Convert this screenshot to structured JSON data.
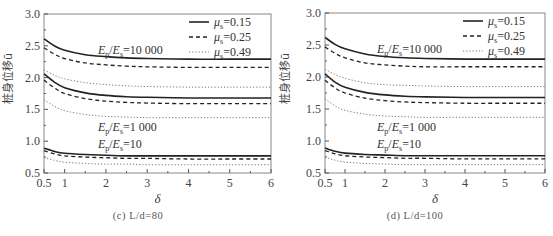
{
  "figure": {
    "captions": [
      "(c) L/d=80",
      "(d) L/d=100"
    ],
    "ylabel": "桩身位移ū",
    "xlabel": "δ",
    "legend": [
      {
        "label": "μs=0.15",
        "mu": "μ",
        "sub": "s",
        "value": "=0.15",
        "style": "solid"
      },
      {
        "label": "μs=0.25",
        "mu": "μ",
        "sub": "s",
        "value": "=0.25",
        "style": "dashed"
      },
      {
        "label": "μs=0.49",
        "mu": "μ",
        "sub": "s",
        "value": "=0.49",
        "style": "dotted"
      }
    ],
    "annotations": [
      "Ep/Es=10 000",
      "Ep/Es=1 000",
      "Ep/Es=10"
    ],
    "colors": {
      "line": "#222222",
      "dotted": "#777777",
      "axis": "#555555"
    }
  },
  "chart_data": [
    {
      "type": "line",
      "title": "(c) L/d=80",
      "xlabel": "δ",
      "ylabel": "桩身位移ū",
      "xlim": [
        0.5,
        6
      ],
      "ylim": [
        0.5,
        3.0
      ],
      "xticks": [
        0.5,
        1,
        2,
        3,
        4,
        5,
        6
      ],
      "xtick_labels": [
        "0.5",
        "1",
        "2",
        "3",
        "4",
        "5",
        "6"
      ],
      "yticks": [
        0.5,
        1.0,
        1.5,
        2.0,
        2.5,
        3.0
      ],
      "ytick_labels": [
        "0.5",
        "1.0",
        "1.5",
        "2.0",
        "2.5",
        "3.0"
      ],
      "grid": false,
      "legend_position": "upper right",
      "x": [
        0.5,
        0.75,
        1,
        1.5,
        2,
        2.5,
        3,
        4,
        5,
        6
      ],
      "series": [
        {
          "name": "Ep/Es=10 000, μs=0.15",
          "style": "solid",
          "values": [
            2.61,
            2.5,
            2.43,
            2.36,
            2.33,
            2.31,
            2.3,
            2.29,
            2.29,
            2.29
          ]
        },
        {
          "name": "Ep/Es=10 000, μs=0.25",
          "style": "dashed",
          "values": [
            2.47,
            2.37,
            2.3,
            2.23,
            2.2,
            2.18,
            2.17,
            2.16,
            2.16,
            2.16
          ]
        },
        {
          "name": "Ep/Es=10 000, μs=0.49",
          "style": "dotted",
          "values": [
            2.12,
            2.04,
            1.98,
            1.92,
            1.89,
            1.87,
            1.86,
            1.85,
            1.85,
            1.85
          ]
        },
        {
          "name": "Ep/Es=1 000, μs=0.15",
          "style": "solid",
          "values": [
            2.06,
            1.93,
            1.84,
            1.76,
            1.72,
            1.7,
            1.69,
            1.68,
            1.68,
            1.68
          ]
        },
        {
          "name": "Ep/Es=1 000, μs=0.25",
          "style": "dashed",
          "values": [
            1.96,
            1.84,
            1.75,
            1.67,
            1.63,
            1.61,
            1.6,
            1.59,
            1.59,
            1.59
          ]
        },
        {
          "name": "Ep/Es=1 000, μs=0.49",
          "style": "dotted",
          "values": [
            1.65,
            1.55,
            1.48,
            1.42,
            1.39,
            1.38,
            1.37,
            1.37,
            1.37,
            1.37
          ]
        },
        {
          "name": "Ep/Es=10, μs=0.15",
          "style": "solid",
          "values": [
            0.89,
            0.84,
            0.81,
            0.79,
            0.78,
            0.77,
            0.77,
            0.77,
            0.77,
            0.77
          ]
        },
        {
          "name": "Ep/Es=10, μs=0.25",
          "style": "dashed",
          "values": [
            0.85,
            0.8,
            0.77,
            0.75,
            0.74,
            0.73,
            0.73,
            0.72,
            0.72,
            0.72
          ]
        },
        {
          "name": "Ep/Es=10, μs=0.49",
          "style": "dotted",
          "values": [
            0.75,
            0.7,
            0.67,
            0.65,
            0.64,
            0.64,
            0.63,
            0.63,
            0.63,
            0.63
          ]
        }
      ],
      "annotations": [
        {
          "text": "Ep/Es=10 000",
          "x": 2.0,
          "y": 2.43
        },
        {
          "text": "Ep/Es=1 000",
          "x": 2.0,
          "y": 1.22
        },
        {
          "text": "Ep/Es=10",
          "x": 2.0,
          "y": 0.96
        }
      ]
    },
    {
      "type": "line",
      "title": "(d) L/d=100",
      "xlabel": "δ",
      "ylabel": "桩身位移ū",
      "xlim": [
        0.5,
        6
      ],
      "ylim": [
        0.5,
        3.0
      ],
      "xticks": [
        0.5,
        1,
        2,
        3,
        4,
        5,
        6
      ],
      "xtick_labels": [
        "0.5",
        "1",
        "2",
        "3",
        "4",
        "5",
        "6"
      ],
      "yticks": [
        0.5,
        1.0,
        1.5,
        2.0,
        2.5,
        3.0
      ],
      "ytick_labels": [
        "0.5",
        "1.0",
        "1.5",
        "2.0",
        "2.5",
        "3.0"
      ],
      "grid": false,
      "legend_position": "upper right",
      "x": [
        0.5,
        0.75,
        1,
        1.5,
        2,
        2.5,
        3,
        4,
        5,
        6
      ],
      "series": [
        {
          "name": "Ep/Es=10 000, μs=0.15",
          "style": "solid",
          "values": [
            2.62,
            2.51,
            2.44,
            2.36,
            2.32,
            2.3,
            2.29,
            2.28,
            2.28,
            2.28
          ]
        },
        {
          "name": "Ep/Es=10 000, μs=0.25",
          "style": "dashed",
          "values": [
            2.47,
            2.37,
            2.3,
            2.22,
            2.19,
            2.17,
            2.16,
            2.16,
            2.16,
            2.16
          ]
        },
        {
          "name": "Ep/Es=10 000, μs=0.49",
          "style": "dotted",
          "values": [
            2.12,
            2.04,
            1.98,
            1.91,
            1.88,
            1.87,
            1.86,
            1.85,
            1.85,
            1.85
          ]
        },
        {
          "name": "Ep/Es=1 000, μs=0.15",
          "style": "solid",
          "values": [
            2.05,
            1.92,
            1.84,
            1.76,
            1.72,
            1.7,
            1.69,
            1.68,
            1.68,
            1.68
          ]
        },
        {
          "name": "Ep/Es=1 000, μs=0.25",
          "style": "dashed",
          "values": [
            1.95,
            1.83,
            1.75,
            1.67,
            1.63,
            1.61,
            1.6,
            1.59,
            1.59,
            1.59
          ]
        },
        {
          "name": "Ep/Es=1 000, μs=0.49",
          "style": "dotted",
          "values": [
            1.66,
            1.55,
            1.48,
            1.42,
            1.39,
            1.38,
            1.37,
            1.37,
            1.37,
            1.37
          ]
        },
        {
          "name": "Ep/Es=10, μs=0.15",
          "style": "solid",
          "values": [
            0.89,
            0.84,
            0.81,
            0.79,
            0.78,
            0.77,
            0.77,
            0.77,
            0.77,
            0.77
          ]
        },
        {
          "name": "Ep/Es=10, μs=0.25",
          "style": "dashed",
          "values": [
            0.85,
            0.8,
            0.77,
            0.75,
            0.74,
            0.73,
            0.73,
            0.72,
            0.72,
            0.72
          ]
        },
        {
          "name": "Ep/Es=10, μs=0.49",
          "style": "dotted",
          "values": [
            0.75,
            0.7,
            0.67,
            0.65,
            0.64,
            0.63,
            0.63,
            0.63,
            0.63,
            0.63
          ]
        }
      ],
      "annotations": [
        {
          "text": "Ep/Es=10 000",
          "x": 2.0,
          "y": 2.43
        },
        {
          "text": "Ep/Es=1 000",
          "x": 2.0,
          "y": 1.22
        },
        {
          "text": "Ep/Es=10",
          "x": 2.0,
          "y": 0.96
        }
      ]
    }
  ]
}
